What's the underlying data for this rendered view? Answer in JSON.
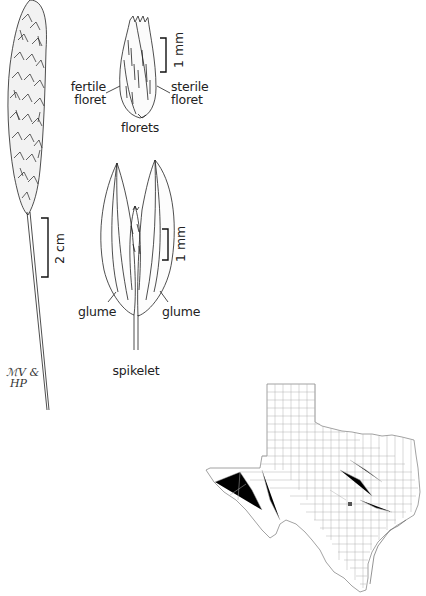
{
  "plate": {
    "header_caption_clipped": "",
    "illustrations": {
      "inflorescence": {
        "scale_label": "2 cm"
      },
      "florets": {
        "title": "florets",
        "label_left_line1": "fertile",
        "label_left_line2": "floret",
        "label_right_line1": "sterile",
        "label_right_line2": "floret",
        "scale_label": "1 mm"
      },
      "spikelet": {
        "title": "spikelet",
        "label_left": "glume",
        "label_right": "glume",
        "scale_label": "1 mm"
      }
    },
    "signature": {
      "line1": "ℳV &",
      "line2": "HP"
    },
    "map": {
      "region": "Texas counties",
      "occurrence_dots": [
        {
          "approx_county": "Travis",
          "x": 350,
          "y": 504
        }
      ],
      "colors": {
        "county_lines": "#9a9a9a",
        "dot": "#555555"
      }
    }
  }
}
